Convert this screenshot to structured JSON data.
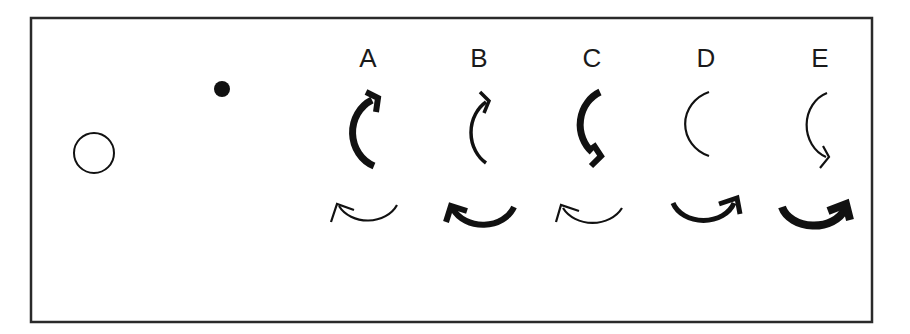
{
  "figure": {
    "frame": {
      "x": 31,
      "y": 18,
      "width": 841,
      "height": 304,
      "stroke": "#2a2a2a"
    },
    "reference_objects": [
      {
        "name": "open-circle",
        "type": "circle",
        "filled": false,
        "cx": 94,
        "cy": 153,
        "r": 20
      },
      {
        "name": "filled-dot",
        "type": "circle",
        "filled": true,
        "cx": 222,
        "cy": 89,
        "r": 8
      }
    ],
    "options": [
      {
        "label": "A",
        "x": 368,
        "top_arrow": {
          "direction": "clockwise-up",
          "weight": "thick"
        },
        "bottom_arrow": {
          "direction": "counterclockwise-left",
          "weight": "thin"
        }
      },
      {
        "label": "B",
        "x": 479,
        "top_arrow": {
          "direction": "clockwise-up",
          "weight": "medium"
        },
        "bottom_arrow": {
          "direction": "counterclockwise-left",
          "weight": "thick"
        }
      },
      {
        "label": "C",
        "x": 592,
        "top_arrow": {
          "direction": "counterclockwise-down",
          "weight": "thick"
        },
        "bottom_arrow": {
          "direction": "counterclockwise-left",
          "weight": "thin"
        }
      },
      {
        "label": "D",
        "x": 706,
        "top_arrow": {
          "direction": "none",
          "weight": "thin"
        },
        "bottom_arrow": {
          "direction": "counterclockwise-right",
          "weight": "thick"
        }
      },
      {
        "label": "E",
        "x": 820,
        "top_arrow": {
          "direction": "counterclockwise-down",
          "weight": "thin"
        },
        "bottom_arrow": {
          "direction": "counterclockwise-right",
          "weight": "extra-thick"
        }
      }
    ]
  }
}
